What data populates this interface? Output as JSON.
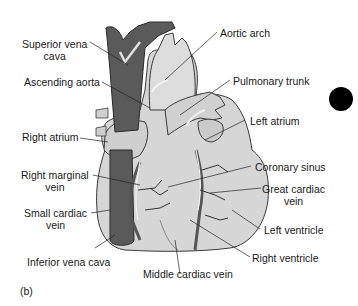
{
  "figure": {
    "panel_label": "(b)",
    "labels": {
      "superior_vena_cava": [
        "Superior vena",
        "cava"
      ],
      "ascending_aorta": "Ascending aorta",
      "right_atrium": "Right atrium",
      "right_marginal_vein": [
        "Right marginal",
        "vein"
      ],
      "small_cardiac_vein": [
        "Small cardiac",
        "vein"
      ],
      "inferior_vena_cava": "Inferior vena cava",
      "middle_cardiac_vein": "Middle cardiac vein",
      "aortic_arch": "Aortic arch",
      "pulmonary_trunk": "Pulmonary trunk",
      "left_atrium": "Left atrium",
      "coronary_sinus": "Coronary sinus",
      "great_cardiac_vein": [
        "Great cardiac",
        "vein"
      ],
      "left_ventricle": "Left ventricle",
      "right_ventricle": "Right ventricle"
    },
    "colors": {
      "vein_dark": "#5a5a5a",
      "heart_light": "#d4d4d4",
      "outline": "#3a3a3a",
      "marker": "#000000"
    }
  }
}
